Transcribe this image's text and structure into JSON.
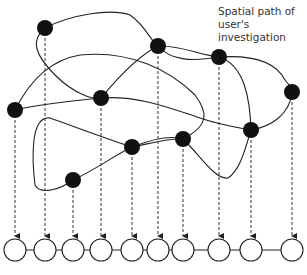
{
  "annotation": {
    "line1": "Spatial path of",
    "line2": "user's",
    "line3": "investigation"
  },
  "spatial_nodes": [
    {
      "id": 1,
      "x": 45,
      "y": 28
    },
    {
      "id": 2,
      "x": 158,
      "y": 46
    },
    {
      "id": 3,
      "x": 219,
      "y": 57
    },
    {
      "id": 4,
      "x": 292,
      "y": 92
    },
    {
      "id": 5,
      "x": 15,
      "y": 110
    },
    {
      "id": 6,
      "x": 101,
      "y": 98
    },
    {
      "id": 7,
      "x": 251,
      "y": 130
    },
    {
      "id": 8,
      "x": 183,
      "y": 139
    },
    {
      "id": 9,
      "x": 132,
      "y": 147
    },
    {
      "id": 10,
      "x": 73,
      "y": 180
    }
  ],
  "timeline_nodes": [
    15,
    45,
    73,
    101,
    132,
    158,
    183,
    219,
    251,
    292
  ],
  "colors": {
    "node_fill": "#111111",
    "line": "#222222",
    "timeline_fill": "#ffffff"
  }
}
